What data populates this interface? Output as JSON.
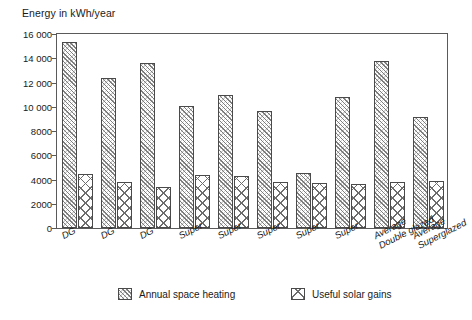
{
  "chart_data": {
    "type": "bar",
    "title": "Energy in kWh/year",
    "xlabel": "",
    "ylabel": "Energy in kWh/year",
    "ylim": [
      0,
      16000
    ],
    "ytick_step": 2000,
    "ytick_labels": [
      "16 000",
      "14 000",
      "12 000",
      "10 000",
      "8000",
      "6000",
      "4000",
      "2000",
      "0"
    ],
    "ytick_values": [
      16000,
      14000,
      12000,
      10000,
      8000,
      6000,
      4000,
      2000,
      0
    ],
    "grid": false,
    "legend_position": "bottom",
    "categories": [
      "DG",
      "DG",
      "DG",
      "Super",
      "Super",
      "Super",
      "Super",
      "Super",
      "Average Double glazed",
      "Average Superglazed"
    ],
    "category_lines": [
      [
        "DG"
      ],
      [
        "DG"
      ],
      [
        "DG"
      ],
      [
        "Super"
      ],
      [
        "Super"
      ],
      [
        "Super"
      ],
      [
        "Super"
      ],
      [
        "Super"
      ],
      [
        "Average",
        "Double glazed"
      ],
      [
        "Average",
        "Superglazed"
      ]
    ],
    "series": [
      {
        "name": "Annual space heating",
        "pattern": "diagonal-hatch",
        "values": [
          15300,
          12400,
          13600,
          10100,
          11000,
          9650,
          4500,
          10800,
          13750,
          9150
        ]
      },
      {
        "name": "Useful solar gains",
        "pattern": "cross-hatch",
        "values": [
          4450,
          3800,
          3400,
          4400,
          4250,
          3800,
          3700,
          3650,
          3800,
          3900
        ]
      }
    ]
  },
  "colors": {
    "axis": "#5a5a5a",
    "bar_outline": "#4a4a4a",
    "hatch": "#6d6d6d",
    "background": "#ffffff",
    "text": "#1a1a1a"
  }
}
